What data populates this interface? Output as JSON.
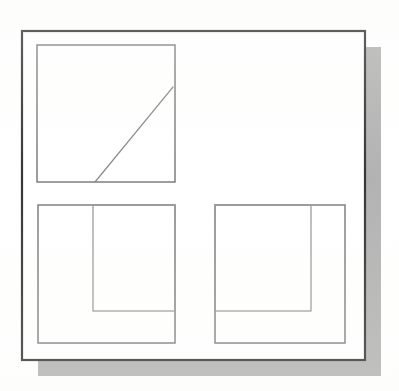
{
  "figure": {
    "domain": "diagram",
    "canvas": {
      "width": 399,
      "height": 391
    },
    "background_color": "#ffffff",
    "stroke_colors": {
      "frame": "#1a1a1a",
      "box": "#6b6b6b",
      "inner_box": "#8a8a8a",
      "diagonal": "#7a7a7a",
      "shadow": "#a8a8a8"
    },
    "stroke_widths": {
      "frame": 2.2,
      "box": 1.5,
      "inner_box": 1.3,
      "diagonal": 1.2
    }
  },
  "shadow": {
    "label": "drop-shadow",
    "x": 38,
    "y": 47,
    "width": 343,
    "height": 329,
    "color": "#a8a8a8",
    "offset_x": 16,
    "offset_y": 16
  },
  "frame": {
    "label": "outer-frame",
    "x": 22,
    "y": 31,
    "width": 343,
    "height": 329
  },
  "panels": [
    {
      "id": "panel-top-left",
      "label": "Top left panel with diagonal line",
      "x": 37,
      "y": 45,
      "width": 138,
      "height": 137,
      "content_type": "diagonal-line",
      "diagonal": {
        "x1": 95,
        "y1": 182,
        "x2": 173,
        "y2": 87
      }
    },
    {
      "id": "panel-bottom-left",
      "label": "Bottom left panel with inner notch rectangle",
      "x": 38,
      "y": 205,
      "width": 137,
      "height": 138,
      "content_type": "inner-rectangle",
      "inner": {
        "x": 93,
        "y": 205,
        "width": 82,
        "height": 106
      }
    },
    {
      "id": "panel-bottom-right",
      "label": "Bottom right panel with mirrored inner notch rectangle",
      "x": 215,
      "y": 205,
      "width": 130,
      "height": 138,
      "content_type": "inner-rectangle",
      "inner": {
        "x": 215,
        "y": 205,
        "width": 96,
        "height": 106
      }
    }
  ]
}
